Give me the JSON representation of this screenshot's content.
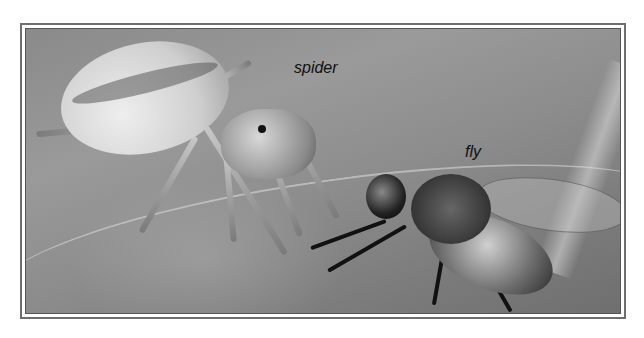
{
  "figure": {
    "labels": {
      "spider": "spider",
      "fly": "fly"
    },
    "frame_color": "#6e6e6e"
  }
}
